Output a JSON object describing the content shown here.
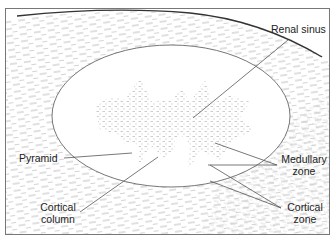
{
  "figure": {
    "labels": {
      "renal_sinus": "Renal sinus",
      "pyramid": "Pyramid",
      "medullary_zone_line1": "Medullary",
      "medullary_zone_line2": "zone",
      "cortical_column_line1": "Cortical",
      "cortical_column_line2": "column",
      "cortical_zone_line1": "Cortical",
      "cortical_zone_line2": "zone"
    },
    "colors": {
      "line": "#555555",
      "hatch": "#9a9a9a",
      "text": "#222222",
      "background": "#ffffff"
    }
  }
}
